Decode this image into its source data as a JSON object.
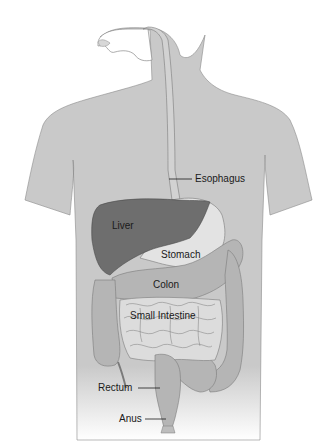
{
  "diagram": {
    "labels": [
      {
        "id": "esophagus",
        "text": "Esophagus"
      },
      {
        "id": "liver",
        "text": "Liver"
      },
      {
        "id": "stomach",
        "text": "Stomach"
      },
      {
        "id": "colon",
        "text": "Colon"
      },
      {
        "id": "small_intestine",
        "text": "Small Intestine"
      },
      {
        "id": "rectum",
        "text": "Rectum"
      },
      {
        "id": "anus",
        "text": "Anus"
      }
    ],
    "colors": {
      "body": "#c9c9c9",
      "body_outline": "#8a8a8a",
      "liver": "#6e6e6e",
      "stomach": "#e3e3e3",
      "colon": "#b5b5b5",
      "small_intestine": "#dcdcdc",
      "label_text": "#1a1a1a"
    }
  }
}
